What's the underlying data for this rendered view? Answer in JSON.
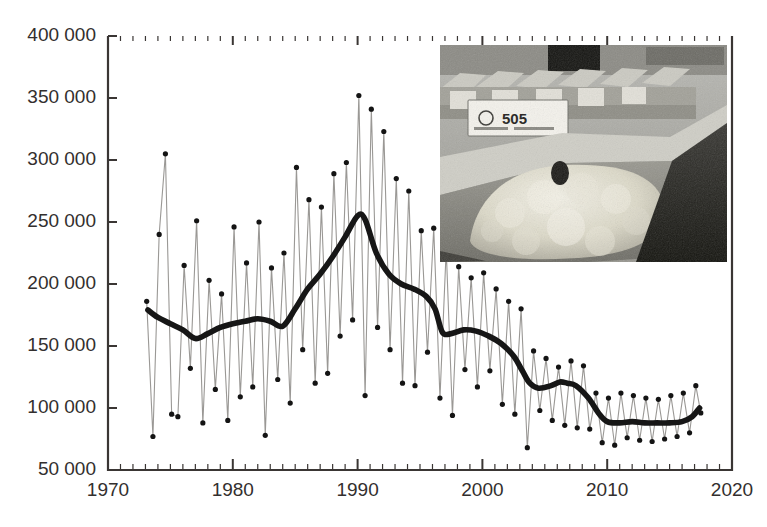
{
  "figure": {
    "name": "wool-bale-production-chart",
    "background": "#ffffff",
    "frame_color": "#3a3634",
    "raw_series_color": "#9a9895",
    "marker_color": "#1a1a1a",
    "smooth_series_color": "#161616"
  },
  "axes": {
    "y": {
      "ticks": [
        50000,
        100000,
        150000,
        200000,
        250000,
        300000,
        350000,
        400000
      ],
      "tick_labels": [
        "50 000",
        "100 000",
        "150 000",
        "200 000",
        "250 000",
        "300 000",
        "350 000",
        "400 000"
      ],
      "min": 50000,
      "max": 400000,
      "label": ""
    },
    "x": {
      "ticks": [
        1970,
        1980,
        1990,
        2000,
        2010,
        2020
      ],
      "tick_labels": [
        "1970",
        "1980",
        "1990",
        "2000",
        "2010",
        "2020"
      ],
      "minor_tick_step": 1,
      "min": 1970,
      "max": 2020,
      "label": ""
    }
  },
  "inset": {
    "name": "wool-warehouse-photo",
    "alt": "Grayscale photo of wool bins in a warehouse with numbered lot labels",
    "lot_label": "505",
    "caption": ""
  },
  "chart_data": {
    "type": "line",
    "title": "",
    "subtitle": "",
    "xlabel": "",
    "ylabel": "",
    "xlim": [
      1970,
      2020
    ],
    "ylim": [
      50000,
      400000
    ],
    "grid": false,
    "legend": null,
    "series": [
      {
        "name": "Seasonal observations",
        "style": "thin-line-with-markers",
        "x": [
          1973.1,
          1973.6,
          1974.1,
          1974.6,
          1975.1,
          1975.6,
          1976.1,
          1976.6,
          1977.1,
          1977.6,
          1978.1,
          1978.6,
          1979.1,
          1979.6,
          1980.1,
          1980.6,
          1981.1,
          1981.6,
          1982.1,
          1982.6,
          1983.1,
          1983.6,
          1984.1,
          1984.6,
          1985.1,
          1985.6,
          1986.1,
          1986.6,
          1987.1,
          1987.6,
          1988.1,
          1988.6,
          1989.1,
          1989.6,
          1990.1,
          1990.6,
          1991.1,
          1991.6,
          1992.1,
          1992.6,
          1993.1,
          1993.6,
          1994.1,
          1994.6,
          1995.1,
          1995.6,
          1996.1,
          1996.6,
          1997.1,
          1997.6,
          1998.1,
          1998.6,
          1999.1,
          1999.6,
          2000.1,
          2000.6,
          2001.1,
          2001.6,
          2002.1,
          2002.6,
          2003.1,
          2003.6,
          2004.1,
          2004.6,
          2005.1,
          2005.6,
          2006.1,
          2006.6,
          2007.1,
          2007.6,
          2008.1,
          2008.6,
          2009.1,
          2009.6,
          2010.1,
          2010.6,
          2011.1,
          2011.6,
          2012.1,
          2012.6,
          2013.1,
          2013.6,
          2014.1,
          2014.6,
          2015.1,
          2015.6,
          2016.1,
          2016.6,
          2017.1,
          2017.5
        ],
        "values": [
          186000,
          77000,
          240000,
          305000,
          95000,
          93000,
          215000,
          132000,
          251000,
          88000,
          203000,
          115000,
          192000,
          90000,
          246000,
          109000,
          217000,
          117000,
          250000,
          78000,
          213000,
          123000,
          225000,
          104000,
          294000,
          147000,
          268000,
          120000,
          262000,
          128000,
          289000,
          158000,
          298000,
          171000,
          352000,
          110000,
          341000,
          165000,
          323000,
          147000,
          285000,
          120000,
          275000,
          118000,
          243000,
          145000,
          245000,
          108000,
          228000,
          94000,
          214000,
          131000,
          205000,
          117000,
          209000,
          130000,
          196000,
          103000,
          186000,
          95000,
          180000,
          68000,
          146000,
          98000,
          140000,
          90000,
          133000,
          86000,
          138000,
          84000,
          134000,
          83000,
          112000,
          72000,
          108000,
          70000,
          112000,
          76000,
          110000,
          74000,
          108000,
          73000,
          107000,
          75000,
          110000,
          77000,
          112000,
          80000,
          118000,
          96000
        ]
      },
      {
        "name": "Smoothed trend",
        "style": "thick-line",
        "x": [
          1973.2,
          1974.0,
          1975.0,
          1976.0,
          1977.0,
          1978.0,
          1979.0,
          1980.0,
          1981.0,
          1982.0,
          1983.0,
          1984.0,
          1985.0,
          1986.0,
          1987.0,
          1988.0,
          1989.0,
          1990.0,
          1990.6,
          1991.5,
          1992.5,
          1993.5,
          1994.5,
          1995.5,
          1996.2,
          1996.8,
          1997.5,
          1998.5,
          1999.5,
          2000.5,
          2001.5,
          2002.5,
          2003.2,
          2003.8,
          2004.5,
          2005.5,
          2006.2,
          2006.8,
          2007.5,
          2008.5,
          2009.3,
          2010.0,
          2011.0,
          2012.0,
          2013.0,
          2014.0,
          2015.0,
          2016.0,
          2016.8,
          2017.4
        ],
        "values": [
          179000,
          173000,
          168000,
          163000,
          156000,
          160000,
          165000,
          168000,
          170000,
          172000,
          170000,
          166000,
          180000,
          196000,
          208000,
          222000,
          238000,
          255000,
          252000,
          225000,
          208000,
          200000,
          196000,
          190000,
          180000,
          161000,
          160000,
          163000,
          162000,
          158000,
          152000,
          142000,
          130000,
          120000,
          116000,
          118000,
          121000,
          120000,
          118000,
          108000,
          96000,
          89000,
          88000,
          89000,
          88000,
          88000,
          88000,
          89000,
          93000,
          100000
        ]
      }
    ]
  }
}
